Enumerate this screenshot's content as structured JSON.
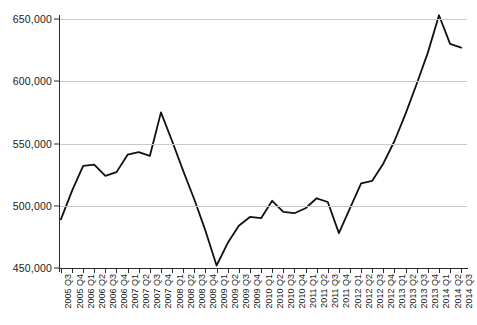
{
  "chart_data": {
    "type": "line",
    "title": "",
    "subtitle": "",
    "xlabel": "",
    "ylabel": "",
    "ylim": [
      450000,
      650000
    ],
    "ytick_values": [
      450000,
      500000,
      550000,
      600000,
      650000
    ],
    "ytick_labels": [
      "450,000",
      "500,000",
      "550,000",
      "600,000",
      "650,000"
    ],
    "grid": true,
    "legend": false,
    "legend_position": "none",
    "line_color": "#111111",
    "grid_color": "#c9c9c9",
    "axis_color": "#2b2b2b",
    "categories": [
      "2005 Q3",
      "2005 Q4",
      "2006 Q1",
      "2006 Q2",
      "2006 Q3",
      "2006 Q4",
      "2007 Q1",
      "2007 Q2",
      "2007 Q3",
      "2007 Q4",
      "2008 Q1",
      "2008 Q2",
      "2008 Q3",
      "2008 Q4",
      "2009 Q1",
      "2009 Q2",
      "2009 Q3",
      "2009 Q4",
      "2010 Q1",
      "2010 Q2",
      "2010 Q3",
      "2010 Q4",
      "2011 Q1",
      "2011 Q2",
      "2011 Q3",
      "2011 Q4",
      "2012 Q1",
      "2012 Q2",
      "2012 Q3",
      "2012 Q4",
      "2013 Q1",
      "2013 Q2",
      "2013 Q3",
      "2013 Q4",
      "2014 Q1",
      "2014 Q2",
      "2014 Q3"
    ],
    "values": [
      489000,
      512000,
      532000,
      533000,
      524000,
      527000,
      541000,
      543000,
      540000,
      575000,
      552000,
      528000,
      505000,
      480000,
      452000,
      470000,
      484000,
      491000,
      490000,
      504000,
      495000,
      494000,
      498000,
      506000,
      503000,
      478000,
      498000,
      518000,
      520000,
      534000,
      552000,
      574000,
      598000,
      623000,
      653000,
      630000,
      627000
    ],
    "series": [
      {
        "name": "series-1",
        "values": [
          489000,
          512000,
          532000,
          533000,
          524000,
          527000,
          541000,
          543000,
          540000,
          575000,
          552000,
          528000,
          505000,
          480000,
          452000,
          470000,
          484000,
          491000,
          490000,
          504000,
          495000,
          494000,
          498000,
          506000,
          503000,
          478000,
          498000,
          518000,
          520000,
          534000,
          552000,
          574000,
          598000,
          623000,
          653000,
          630000,
          627000
        ]
      }
    ],
    "annotations": []
  }
}
